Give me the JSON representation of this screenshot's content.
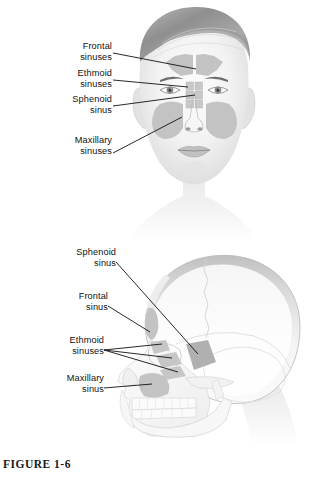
{
  "figure": {
    "caption": "FIGURE 1-6",
    "background_color": "#ffffff",
    "ink_color": "#111111",
    "sinus_fill_color": "#c3c3c3",
    "sinus_fill_color_dark": "#b0b0b0"
  },
  "panels": [
    {
      "id": "anterior-view",
      "view_name": "anterior-face-view",
      "description": "Front view of a human head showing paranasal sinuses shaded on the face",
      "labels": [
        {
          "id": "frontal",
          "line1": "Frontal",
          "line2": "sinuses"
        },
        {
          "id": "ethmoid",
          "line1": "Ethmoid",
          "line2": "sinuses"
        },
        {
          "id": "sphenoid",
          "line1": "Sphenoid",
          "line2": "sinus"
        },
        {
          "id": "maxillary",
          "line1": "Maxillary",
          "line2": "sinuses"
        }
      ]
    },
    {
      "id": "lateral-view",
      "view_name": "lateral-skull-view",
      "description": "Side view of a human skull showing paranasal sinuses shaded",
      "labels": [
        {
          "id": "sphenoid",
          "line1": "Sphenoid",
          "line2": "sinus"
        },
        {
          "id": "frontal",
          "line1": "Frontal",
          "line2": "sinus"
        },
        {
          "id": "ethmoid",
          "line1": "Ethmoid",
          "line2": "sinuses"
        },
        {
          "id": "maxillary",
          "line1": "Maxillary",
          "line2": "sinus"
        }
      ]
    }
  ]
}
